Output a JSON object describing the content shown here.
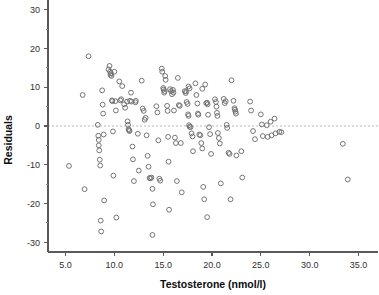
{
  "chart_data": {
    "type": "scatter",
    "title": "",
    "xlabel": "Testosterone (nmol/l)",
    "ylabel": "Residuals",
    "xlim": [
      3.2,
      37.0
    ],
    "ylim": [
      -32.5,
      32.5
    ],
    "grid": false,
    "legend": null,
    "x_ticks": [
      5.0,
      10.0,
      15.0,
      20.0,
      25.0,
      30.0,
      35.0
    ],
    "x_tick_labels": [
      "5.0",
      "10.0",
      "15.0",
      "20.0",
      "25.0",
      "30.0",
      "35.0"
    ],
    "y_ticks": [
      -30,
      -20,
      -10,
      0,
      10,
      20,
      30
    ],
    "y_tick_labels": [
      "-30",
      "-20",
      "-10",
      "0",
      "10",
      "20",
      "30"
    ],
    "x_minor_ticks": [
      7.5,
      12.5,
      17.5,
      22.5,
      27.5,
      32.5
    ],
    "y_minor_ticks": [
      -25,
      -15,
      -5,
      5,
      15,
      25
    ],
    "annotations": [
      {
        "type": "hline",
        "y": 0,
        "style": "dashed",
        "color": "#b9b9b9"
      }
    ],
    "marker": {
      "shape": "open-circle",
      "radius": 2.4,
      "stroke_color": "#6e6e6e",
      "fill": "none"
    },
    "series": [
      {
        "name": "residuals",
        "points": [
          [
            5.35,
            -10.3
          ],
          [
            6.75,
            8.0
          ],
          [
            6.95,
            -16.3
          ],
          [
            7.35,
            18.0
          ],
          [
            8.3,
            0.3
          ],
          [
            8.35,
            -2.5
          ],
          [
            8.4,
            -3.6
          ],
          [
            8.4,
            -5.0
          ],
          [
            8.45,
            -6.3
          ],
          [
            8.5,
            -8.7
          ],
          [
            8.55,
            -10.2
          ],
          [
            8.6,
            -24.4
          ],
          [
            8.65,
            -27.2
          ],
          [
            8.75,
            9.2
          ],
          [
            8.8,
            5.5
          ],
          [
            8.85,
            3.2
          ],
          [
            8.9,
            -2.2
          ],
          [
            8.95,
            -19.2
          ],
          [
            9.4,
            14.6
          ],
          [
            9.5,
            15.5
          ],
          [
            9.55,
            14.0
          ],
          [
            9.6,
            13.2
          ],
          [
            9.65,
            13.6
          ],
          [
            9.7,
            12.9
          ],
          [
            9.75,
            6.6
          ],
          [
            9.8,
            6.4
          ],
          [
            9.85,
            -1.4
          ],
          [
            9.9,
            -12.8
          ],
          [
            10.0,
            14.0
          ],
          [
            10.1,
            6.4
          ],
          [
            10.15,
            4.0
          ],
          [
            10.2,
            -23.6
          ],
          [
            10.5,
            11.5
          ],
          [
            10.6,
            6.6
          ],
          [
            10.7,
            6.9
          ],
          [
            10.8,
            10.3
          ],
          [
            11.0,
            5.6
          ],
          [
            11.1,
            4.7
          ],
          [
            11.3,
            6.3
          ],
          [
            11.35,
            1.2
          ],
          [
            11.4,
            0.3
          ],
          [
            11.45,
            -0.8
          ],
          [
            11.5,
            -1.1
          ],
          [
            11.55,
            -1.3
          ],
          [
            11.6,
            6.5
          ],
          [
            11.7,
            8.6
          ],
          [
            11.75,
            6.3
          ],
          [
            11.85,
            -5.3
          ],
          [
            11.9,
            -8.6
          ],
          [
            12.0,
            -14.2
          ],
          [
            12.15,
            6.1
          ],
          [
            12.2,
            6.5
          ],
          [
            12.4,
            -2.0
          ],
          [
            12.5,
            -11.5
          ],
          [
            12.8,
            11.7
          ],
          [
            12.9,
            4.5
          ],
          [
            13.0,
            3.9
          ],
          [
            13.1,
            1.6
          ],
          [
            13.2,
            2.1
          ],
          [
            13.3,
            -2.4
          ],
          [
            13.4,
            -7.7
          ],
          [
            13.5,
            -10.5
          ],
          [
            13.6,
            -13.4
          ],
          [
            13.7,
            -13.5
          ],
          [
            13.8,
            -13.3
          ],
          [
            13.9,
            -16.2
          ],
          [
            13.95,
            -20.2
          ],
          [
            13.9,
            -28.1
          ],
          [
            14.3,
            5.1
          ],
          [
            14.4,
            3.5
          ],
          [
            14.5,
            -3.7
          ],
          [
            14.6,
            -13.6
          ],
          [
            14.7,
            -14.1
          ],
          [
            14.85,
            14.8
          ],
          [
            14.9,
            14.0
          ],
          [
            15.0,
            9.8
          ],
          [
            15.05,
            9.4
          ],
          [
            15.1,
            8.6
          ],
          [
            15.15,
            9.0
          ],
          [
            15.2,
            12.9
          ],
          [
            15.25,
            11.9
          ],
          [
            15.4,
            5.2
          ],
          [
            15.45,
            3.9
          ],
          [
            15.5,
            -2.8
          ],
          [
            15.55,
            -9.2
          ],
          [
            15.6,
            -21.6
          ],
          [
            15.7,
            9.5
          ],
          [
            15.8,
            9.0
          ],
          [
            15.9,
            8.2
          ],
          [
            16.0,
            9.3
          ],
          [
            16.05,
            8.6
          ],
          [
            16.1,
            4.0
          ],
          [
            16.2,
            -3.0
          ],
          [
            16.3,
            -4.4
          ],
          [
            16.4,
            -14.2
          ],
          [
            16.5,
            12.4
          ],
          [
            16.6,
            5.4
          ],
          [
            16.7,
            5.2
          ],
          [
            16.8,
            -4.4
          ],
          [
            16.9,
            -17.1
          ],
          [
            17.2,
            9.0
          ],
          [
            17.3,
            8.5
          ],
          [
            17.35,
            8.9
          ],
          [
            17.4,
            6.2
          ],
          [
            17.5,
            5.7
          ],
          [
            17.55,
            3.0
          ],
          [
            17.6,
            2.6
          ],
          [
            17.65,
            0.2
          ],
          [
            17.7,
            -0.2
          ],
          [
            17.8,
            -0.3
          ],
          [
            17.9,
            -1.9
          ],
          [
            18.0,
            -2.7
          ],
          [
            18.05,
            -6.5
          ],
          [
            17.6,
            10.2
          ],
          [
            17.7,
            9.7
          ],
          [
            18.3,
            11.0
          ],
          [
            18.4,
            8.0
          ],
          [
            18.5,
            5.8
          ],
          [
            18.55,
            3.2
          ],
          [
            18.6,
            2.9
          ],
          [
            18.7,
            -2.2
          ],
          [
            18.8,
            -2.4
          ],
          [
            18.9,
            -4.4
          ],
          [
            19.0,
            -5.8
          ],
          [
            19.1,
            -15.7
          ],
          [
            19.2,
            -18.9
          ],
          [
            19.0,
            9.6
          ],
          [
            19.3,
            10.7
          ],
          [
            19.4,
            5.9
          ],
          [
            19.5,
            6.0
          ],
          [
            19.55,
            5.6
          ],
          [
            19.6,
            2.9
          ],
          [
            19.7,
            -0.3
          ],
          [
            19.8,
            -2.1
          ],
          [
            19.9,
            -7.2
          ],
          [
            19.5,
            -23.5
          ],
          [
            20.3,
            6.9
          ],
          [
            20.4,
            6.2
          ],
          [
            20.45,
            5.0
          ],
          [
            20.5,
            3.4
          ],
          [
            20.55,
            2.6
          ],
          [
            20.6,
            -1.8
          ],
          [
            20.7,
            -3.1
          ],
          [
            20.8,
            -4.5
          ],
          [
            20.9,
            -14.8
          ],
          [
            21.2,
            7.0
          ],
          [
            21.3,
            5.9
          ],
          [
            21.4,
            6.4
          ],
          [
            21.5,
            0.3
          ],
          [
            21.55,
            -0.5
          ],
          [
            21.7,
            -6.9
          ],
          [
            21.8,
            -7.2
          ],
          [
            21.9,
            -18.9
          ],
          [
            22.0,
            11.8
          ],
          [
            22.2,
            6.5
          ],
          [
            22.3,
            4.6
          ],
          [
            22.35,
            4.2
          ],
          [
            22.4,
            3.7
          ],
          [
            22.45,
            3.2
          ],
          [
            22.5,
            -7.6
          ],
          [
            23.0,
            -6.5
          ],
          [
            23.1,
            -13.3
          ],
          [
            23.9,
            6.3
          ],
          [
            24.0,
            4.0
          ],
          [
            24.2,
            -1.3
          ],
          [
            24.4,
            -3.4
          ],
          [
            25.0,
            3.0
          ],
          [
            25.1,
            0.4
          ],
          [
            25.2,
            -2.6
          ],
          [
            25.6,
            0.2
          ],
          [
            25.7,
            -2.8
          ],
          [
            26.0,
            1.1
          ],
          [
            26.1,
            -2.4
          ],
          [
            26.4,
            1.9
          ],
          [
            26.5,
            -1.9
          ],
          [
            26.9,
            -1.5
          ],
          [
            27.1,
            -1.6
          ],
          [
            33.4,
            -4.6
          ],
          [
            33.9,
            -13.8
          ]
        ]
      }
    ]
  }
}
